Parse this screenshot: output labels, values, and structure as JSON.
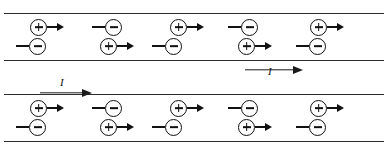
{
  "figure": {
    "background": "#ffffff",
    "line_color": "#2b2b2b",
    "ink_color": "#111111"
  },
  "symbols": {
    "plus": "+",
    "minus": "−",
    "arrow_right": "→",
    "arrow_left": "←"
  },
  "conductors": [
    {
      "name": "conductor-top",
      "top": 13,
      "height": 48,
      "current": {
        "label": "I",
        "direction": "right",
        "placement": "below-right",
        "arrow_left": 245,
        "arrow_width": 58,
        "arrow_top": 62,
        "label_left": 268,
        "label_top": 66
      },
      "rows": [
        {
          "name": "carrier-row-upper",
          "top": 4,
          "carriers": [
            {
              "charge": "plus",
              "sign": "+",
              "direction": "right",
              "x": 30
            },
            {
              "charge": "minus",
              "sign": "−",
              "direction": "left",
              "x": 88
            },
            {
              "charge": "plus",
              "sign": "+",
              "direction": "right",
              "x": 170
            },
            {
              "charge": "minus",
              "sign": "−",
              "direction": "left",
              "x": 224
            },
            {
              "charge": "plus",
              "sign": "+",
              "direction": "right",
              "x": 310
            }
          ]
        },
        {
          "name": "carrier-row-lower",
          "top": 23,
          "carriers": [
            {
              "charge": "minus",
              "sign": "−",
              "direction": "left",
              "x": 12
            },
            {
              "charge": "plus",
              "sign": "+",
              "direction": "right",
              "x": 100
            },
            {
              "charge": "minus",
              "sign": "−",
              "direction": "left",
              "x": 148
            },
            {
              "charge": "plus",
              "sign": "+",
              "direction": "right",
              "x": 238
            },
            {
              "charge": "minus",
              "sign": "−",
              "direction": "left",
              "x": 292
            }
          ]
        }
      ]
    },
    {
      "name": "conductor-bottom",
      "top": 94,
      "height": 48,
      "current": {
        "label": "I",
        "direction": "right",
        "placement": "above-left",
        "arrow_left": 40,
        "arrow_width": 52,
        "arrow_top": 85,
        "label_left": 60,
        "label_top": 77
      },
      "rows": [
        {
          "name": "carrier-row-upper",
          "top": 4,
          "carriers": [
            {
              "charge": "plus",
              "sign": "+",
              "direction": "right",
              "x": 30
            },
            {
              "charge": "minus",
              "sign": "−",
              "direction": "left",
              "x": 88
            },
            {
              "charge": "plus",
              "sign": "+",
              "direction": "right",
              "x": 170
            },
            {
              "charge": "minus",
              "sign": "−",
              "direction": "left",
              "x": 224
            },
            {
              "charge": "plus",
              "sign": "+",
              "direction": "right",
              "x": 310
            }
          ]
        },
        {
          "name": "carrier-row-lower",
          "top": 23,
          "carriers": [
            {
              "charge": "minus",
              "sign": "−",
              "direction": "left",
              "x": 12
            },
            {
              "charge": "plus",
              "sign": "+",
              "direction": "right",
              "x": 100
            },
            {
              "charge": "minus",
              "sign": "−",
              "direction": "left",
              "x": 148
            },
            {
              "charge": "plus",
              "sign": "+",
              "direction": "right",
              "x": 238
            },
            {
              "charge": "minus",
              "sign": "−",
              "direction": "left",
              "x": 292
            }
          ]
        }
      ]
    }
  ]
}
